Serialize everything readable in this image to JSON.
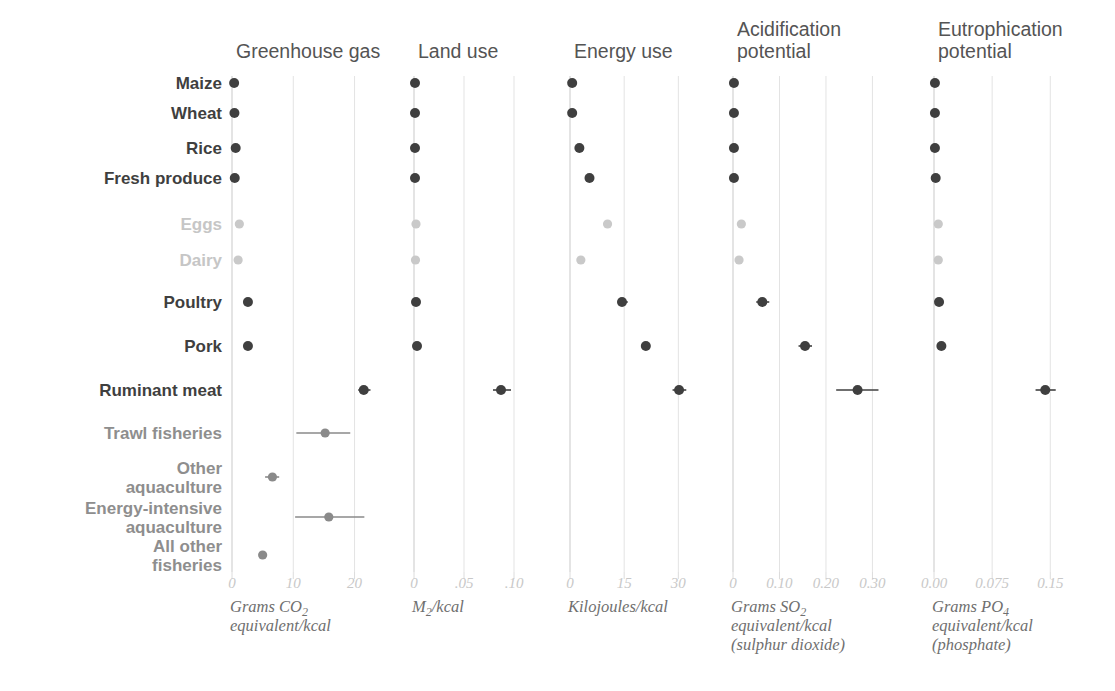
{
  "figure": {
    "background": "#ffffff",
    "colors": {
      "dark": "#3f3f3f",
      "mid": "#8a8a8a",
      "light": "#c9c9c9",
      "gridline": "#e3e3e3",
      "tick_text": "#c8c8c8",
      "caption_text": "#6f6f6f"
    }
  },
  "rows": [
    {
      "label": "Maize",
      "tone": "dark"
    },
    {
      "label": "Wheat",
      "tone": "dark"
    },
    {
      "label": "Rice",
      "tone": "dark"
    },
    {
      "label": "Fresh produce",
      "tone": "dark"
    },
    {
      "label": "Eggs",
      "tone": "light"
    },
    {
      "label": "Dairy",
      "tone": "light"
    },
    {
      "label": "Poultry",
      "tone": "dark"
    },
    {
      "label": "Pork",
      "tone": "dark"
    },
    {
      "label": "Ruminant meat",
      "tone": "dark"
    },
    {
      "label": "Trawl fisheries",
      "tone": "mid"
    },
    {
      "label": "Other aquaculture",
      "tone": "mid"
    },
    {
      "label": "Energy-intensive aquaculture",
      "tone": "mid"
    },
    {
      "label": "All other fisheries",
      "tone": "mid"
    }
  ],
  "chart_data": {
    "type": "scatter",
    "title": "",
    "categories": [
      "Maize",
      "Wheat",
      "Rice",
      "Fresh produce",
      "Eggs",
      "Dairy",
      "Poultry",
      "Pork",
      "Ruminant meat",
      "Trawl fisheries",
      "Other aquaculture",
      "Energy-intensive aquaculture",
      "All other fisheries"
    ],
    "legend_position": "none",
    "grid": true,
    "panels": [
      {
        "title": "Greenhouse gas",
        "caption": "Grams CO₂ equivalent/kcal",
        "caption_lines": [
          "Grams CO2",
          "equivalent/kcal"
        ],
        "xlim": [
          0,
          23.5
        ],
        "ticks": [
          0,
          10,
          20
        ],
        "tick_labels": [
          "0",
          "10",
          "20"
        ],
        "values": [
          0.35,
          0.4,
          0.6,
          0.45,
          1.2,
          1.0,
          2.6,
          2.6,
          21.5,
          15.2,
          6.6,
          15.8,
          5.0
        ],
        "err_low": [
          0.35,
          0.4,
          0.6,
          0.45,
          1.2,
          1.0,
          2.6,
          2.6,
          20.6,
          10.5,
          5.4,
          10.3,
          5.0
        ],
        "err_high": [
          0.35,
          0.4,
          0.6,
          0.45,
          1.2,
          1.0,
          2.6,
          2.6,
          22.6,
          19.3,
          7.7,
          21.6,
          5.0
        ],
        "tone": [
          "dark",
          "dark",
          "dark",
          "dark",
          "light",
          "light",
          "dark",
          "dark",
          "dark",
          "mid",
          "mid",
          "mid",
          "mid"
        ]
      },
      {
        "title": "Land use",
        "caption": "M²/kcal",
        "caption_lines": [
          "M2/kcal"
        ],
        "xlim": [
          0,
          0.122
        ],
        "ticks": [
          0,
          0.05,
          0.1
        ],
        "tick_labels": [
          "0",
          ".05",
          ".10"
        ],
        "values": [
          0.001,
          0.001,
          0.001,
          0.001,
          0.002,
          0.0015,
          0.002,
          0.003,
          0.087,
          null,
          null,
          null,
          null
        ],
        "err_low": [
          0.001,
          0.001,
          0.001,
          0.001,
          0.002,
          0.0015,
          0.002,
          0.003,
          0.079,
          null,
          null,
          null,
          null
        ],
        "err_high": [
          0.001,
          0.001,
          0.001,
          0.001,
          0.002,
          0.0015,
          0.002,
          0.003,
          0.097,
          null,
          null,
          null,
          null
        ],
        "tone": [
          "dark",
          "dark",
          "dark",
          "dark",
          "light",
          "light",
          "dark",
          "dark",
          "dark",
          null,
          null,
          null,
          null
        ]
      },
      {
        "title": "Energy use",
        "caption": "Kilojoules/kcal",
        "caption_lines": [
          "Kilojoules/kcal"
        ],
        "xlim": [
          0,
          36
        ],
        "ticks": [
          0,
          15,
          30
        ],
        "tick_labels": [
          "0",
          "15",
          "30"
        ],
        "values": [
          0.6,
          0.6,
          2.6,
          5.4,
          10.4,
          3.0,
          14.4,
          21.0,
          30.2,
          null,
          null,
          null,
          null
        ],
        "err_low": [
          0.6,
          0.6,
          2.6,
          4.4,
          10.4,
          3.0,
          13.2,
          20.0,
          28.4,
          null,
          null,
          null,
          null
        ],
        "err_high": [
          0.6,
          0.6,
          2.6,
          6.4,
          10.4,
          3.0,
          16.0,
          22.2,
          32.2,
          null,
          null,
          null,
          null
        ],
        "tone": [
          "dark",
          "dark",
          "dark",
          "dark",
          "light",
          "light",
          "dark",
          "dark",
          "dark",
          null,
          null,
          null,
          null
        ]
      },
      {
        "title": "Acidification potential",
        "title_lines": [
          "Acidification",
          "potential"
        ],
        "caption": "Grams SO₂ equivalent/kcal (sulphur dioxide)",
        "caption_lines": [
          "Grams SO2",
          "equivalent/kcal",
          "(sulphur dioxide)"
        ],
        "xlim": [
          0,
          0.355
        ],
        "ticks": [
          0,
          0.1,
          0.2,
          0.3
        ],
        "tick_labels": [
          "0",
          "0.10",
          "0.20",
          "0.30"
        ],
        "values": [
          0.002,
          0.002,
          0.002,
          0.002,
          0.018,
          0.013,
          0.063,
          0.155,
          0.268,
          null,
          null,
          null,
          null
        ],
        "err_low": [
          0.002,
          0.002,
          0.002,
          0.002,
          0.018,
          0.013,
          0.05,
          0.141,
          0.222,
          null,
          null,
          null,
          null
        ],
        "err_high": [
          0.002,
          0.002,
          0.002,
          0.002,
          0.018,
          0.013,
          0.078,
          0.17,
          0.313,
          null,
          null,
          null,
          null
        ],
        "tone": [
          "dark",
          "dark",
          "dark",
          "dark",
          "light",
          "light",
          "dark",
          "dark",
          "dark",
          null,
          null,
          null,
          null
        ]
      },
      {
        "title": "Eutrophication potential",
        "title_lines": [
          "Eutrophication",
          "potential"
        ],
        "caption": "Grams PO₄ equivalent/kcal (phosphate)",
        "caption_lines": [
          "Grams PO4",
          "equivalent/kcal",
          "(phosphate)"
        ],
        "xlim": [
          0,
          0.178
        ],
        "ticks": [
          0,
          0.075,
          0.15
        ],
        "tick_labels": [
          "0.00",
          "0.075",
          "0.15"
        ],
        "values": [
          0.0012,
          0.0012,
          0.0012,
          0.0022,
          0.0055,
          0.0055,
          0.0065,
          0.0095,
          0.1435,
          null,
          null,
          null,
          null
        ],
        "err_low": [
          0.0012,
          0.0012,
          0.0012,
          0.0022,
          0.0055,
          0.0055,
          0.0065,
          0.0095,
          0.131,
          null,
          null,
          null,
          null
        ],
        "err_high": [
          0.0012,
          0.0012,
          0.0012,
          0.0022,
          0.0055,
          0.0055,
          0.0065,
          0.0095,
          0.157,
          null,
          null,
          null,
          null
        ],
        "tone": [
          "dark",
          "dark",
          "dark",
          "dark",
          "light",
          "light",
          "dark",
          "dark",
          "dark",
          null,
          null,
          null,
          null
        ]
      }
    ]
  }
}
